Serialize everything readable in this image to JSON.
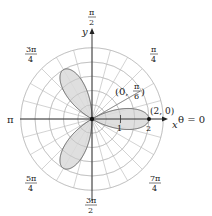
{
  "chart_data": {
    "type": "polar",
    "title": "",
    "equation": "r = 2cos(3θ)",
    "curve": {
      "kind": "rose",
      "amplitude": 2,
      "k": 3,
      "petals": 3,
      "petal_angles": [
        "0",
        "2π/3",
        "4π/3"
      ]
    },
    "grid": {
      "on": true,
      "radial_circles": [
        0.5,
        1,
        1.5,
        2,
        2.5
      ],
      "angular_step": "π/12"
    },
    "annotations": [
      {
        "text": "(2, 0)",
        "r": 2,
        "theta": "0"
      },
      {
        "text": "(0, π/6)",
        "r": 0,
        "theta": "π/6"
      }
    ],
    "axis_labels": {
      "x": "x",
      "y": "y"
    },
    "radial_tick_labels": [
      "1",
      "2"
    ],
    "angle_labels": [
      "θ = 0",
      "π/4",
      "π/2",
      "3π/4",
      "π",
      "5π/4",
      "3π/2",
      "7π/4"
    ]
  },
  "labels": {
    "x_axis": "x",
    "y_axis": "y",
    "theta0": "θ = 0",
    "pi": "π",
    "pi_over_2": {
      "num": "π",
      "den": "2"
    },
    "pi_over_4": {
      "num": "π",
      "den": "4"
    },
    "three_pi_over_4": {
      "num": "3π",
      "den": "4"
    },
    "five_pi_over_4": {
      "num": "5π",
      "den": "4"
    },
    "three_pi_over_2": {
      "num": "3π",
      "den": "2"
    },
    "seven_pi_over_4": {
      "num": "7π",
      "den": "4"
    },
    "tick_1": "1",
    "tick_2": "2",
    "point_2_0": "(2, 0)",
    "point_0_pi6_left": "(0, ",
    "point_0_pi6_num": "π",
    "point_0_pi6_den": "6",
    "point_0_pi6_right": ")"
  },
  "colors": {
    "grid": "#c8c8c8",
    "axis": "#222222",
    "petal_fill": "#d9d9d9",
    "petal_stroke": "#555555"
  }
}
